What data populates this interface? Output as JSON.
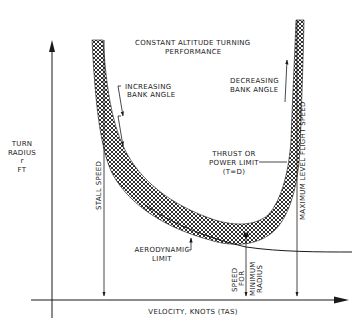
{
  "title": {
    "line1": "CONSTANT ALTITUDE TURNING",
    "line2": "PERFORMANCE"
  },
  "axes": {
    "y_label": {
      "line1": "TURN",
      "line2": "RADIUS",
      "line3": "r",
      "line4": "FT"
    },
    "x_label": "VELOCITY, KNOTS (TAS)"
  },
  "annotations": {
    "increasing_bank": {
      "line1": "INCREASING",
      "line2": "BANK ANGLE"
    },
    "decreasing_bank": {
      "line1": "DECREASING",
      "line2": "BANK ANGLE"
    },
    "thrust_limit": {
      "line1": "THRUST OR",
      "line2": "POWER LIMIT",
      "line3": "(T=D)"
    },
    "aero_limit": {
      "line1": "AERODYNAMIC",
      "line2": "LIMIT"
    },
    "stall_speed": "STALL SPEED",
    "max_speed": "MAXIMUM LEVEL FLIGHT SPEED",
    "min_radius_speed": {
      "line1": "SPEED",
      "line2": "FOR",
      "line3": "MINIMUM",
      "line4": "RADIUS"
    }
  },
  "colors": {
    "ink": "#1a1a1a",
    "background": "#ffffff"
  }
}
